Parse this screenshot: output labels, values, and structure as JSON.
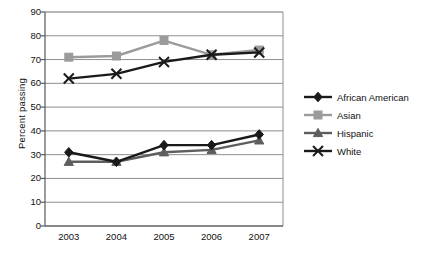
{
  "chart_data": {
    "type": "line",
    "title": "",
    "xlabel": "",
    "ylabel": "Percent passing",
    "categories": [
      "2003",
      "2004",
      "2005",
      "2006",
      "2007"
    ],
    "ylim": [
      0,
      90
    ],
    "yticks": [
      "0",
      "10",
      "20",
      "30",
      "40",
      "50",
      "60",
      "70",
      "80",
      "90"
    ],
    "grid": "horizontal",
    "legend_position": "right",
    "series": [
      {
        "name": "African American",
        "values": [
          31,
          27,
          34,
          34,
          38.5
        ],
        "color": "#1a1a1a",
        "marker": "diamond"
      },
      {
        "name": "Asian",
        "values": [
          71,
          71.5,
          78,
          72,
          74
        ],
        "color": "#9b9b9b",
        "marker": "square"
      },
      {
        "name": "Hispanic",
        "values": [
          27,
          27,
          31,
          32,
          36
        ],
        "color": "#5e5e5e",
        "marker": "triangle"
      },
      {
        "name": "White",
        "values": [
          62,
          64,
          69,
          72,
          73
        ],
        "color": "#1a1a1a",
        "marker": "x"
      }
    ]
  },
  "legend": {
    "items": [
      {
        "label": "African American"
      },
      {
        "label": "Asian"
      },
      {
        "label": "Hispanic"
      },
      {
        "label": "White"
      }
    ]
  },
  "axes": {
    "y_title": "Percent passing"
  }
}
